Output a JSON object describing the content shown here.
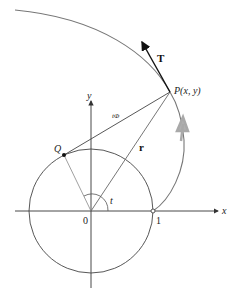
{
  "diagram": {
    "labels": {
      "tangent": "T",
      "point_p": "P(x, y)",
      "point_q": "Q",
      "radius_vector": "r",
      "angle": "t",
      "origin": "0",
      "unit_mark": "1",
      "x_axis": "x",
      "y_axis": "y",
      "segment_label": "tΦ"
    },
    "colors": {
      "curve": "#777777",
      "axis": "#333333",
      "circle": "#444444",
      "vector": "#555555",
      "tangent_arrow": "#111111",
      "direction_arrow": "#a9a9a9"
    },
    "geometry": {
      "origin": [
        91,
        211
      ],
      "unit_radius": 62,
      "point_q": [
        64,
        155
      ],
      "point_p": [
        170,
        92
      ],
      "tangent_tip": [
        141,
        40
      ]
    }
  }
}
